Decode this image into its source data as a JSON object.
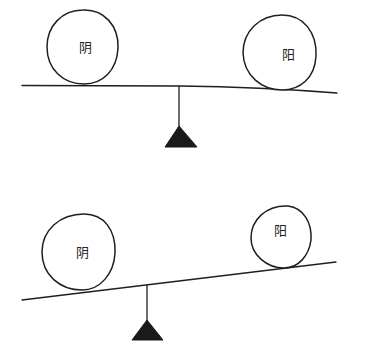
{
  "figure": {
    "panels": [
      {
        "id": "balanced",
        "state": "balanced",
        "left_weight": {
          "label": "阴",
          "size": "equal"
        },
        "right_weight": {
          "label": "阳",
          "size": "equal"
        }
      },
      {
        "id": "unbalanced",
        "state": "yin-heavy",
        "left_weight": {
          "label": "阴",
          "size": "larger"
        },
        "right_weight": {
          "label": "阳",
          "size": "smaller"
        }
      }
    ]
  },
  "colors": {
    "line": "#1f1f1f",
    "fulcrum": "#1a1a1a",
    "background": "#ffffff"
  }
}
